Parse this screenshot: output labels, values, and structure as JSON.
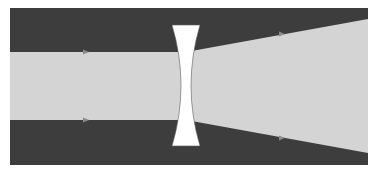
{
  "diagram": {
    "colors": {
      "background": "#ffffff",
      "frame": "#3d3d3d",
      "beam": "#d4d4d4",
      "lens": "#ffffff",
      "arrow": "#8a8a8a"
    },
    "frame": {
      "x": 10,
      "y": 8,
      "width": 358,
      "height": 157
    },
    "incoming_beam": {
      "top_y": 52,
      "bottom_y": 120,
      "x_start": 10,
      "x_end": 186
    },
    "outgoing_beam": {
      "left_top_y": 52,
      "left_bottom_y": 120,
      "right_top_y": 19,
      "right_bottom_y": 153,
      "x_start": 186,
      "x_end": 368
    },
    "lens": {
      "type": "biconcave",
      "x_left": 172,
      "x_right": 200,
      "top_y": 25,
      "bottom_y": 146,
      "waist_left": 181,
      "waist_right": 191
    },
    "arrows": [
      {
        "name": "incoming-top-ray-arrow",
        "x": 86,
        "y": 52
      },
      {
        "name": "incoming-bottom-ray-arrow",
        "x": 86,
        "y": 120
      },
      {
        "name": "outgoing-top-ray-arrow",
        "x": 282,
        "y": 34
      },
      {
        "name": "outgoing-bottom-ray-arrow",
        "x": 282,
        "y": 138
      }
    ]
  }
}
